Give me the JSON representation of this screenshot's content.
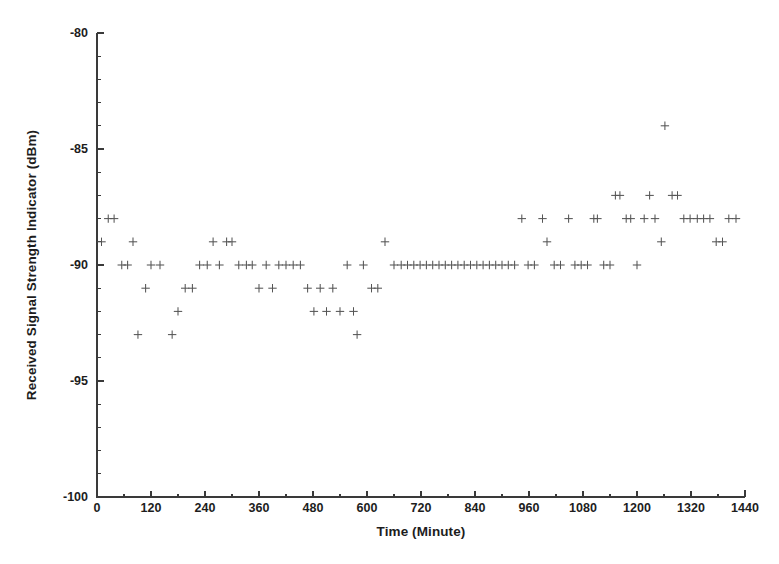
{
  "chart_data": {
    "type": "scatter",
    "title": "",
    "xlabel": "Time (Minute)",
    "ylabel": "Received Signal Strength Indicator (dBm)",
    "xlim": [
      0,
      1440
    ],
    "ylim": [
      -100,
      -80
    ],
    "xticks": [
      0,
      120,
      240,
      360,
      480,
      600,
      720,
      840,
      960,
      1080,
      1200,
      1320,
      1440
    ],
    "xtick_labels": [
      "0",
      "120",
      "240",
      "360",
      "480",
      "600",
      "720",
      "840",
      "960",
      "1080",
      "1200",
      "1320",
      "1440"
    ],
    "x_minor_step": 60,
    "yticks": [
      -80,
      -85,
      -90,
      -95,
      -100
    ],
    "ytick_labels": [
      "-80",
      "-85",
      "-90",
      "-95",
      "-100"
    ],
    "y_minor_step": 1,
    "grid": false,
    "legend": null,
    "marker": "plus",
    "marker_color": "#555555",
    "series": [
      {
        "name": "RSSI",
        "points": [
          [
            10,
            -89
          ],
          [
            25,
            -88
          ],
          [
            38,
            -88
          ],
          [
            55,
            -90
          ],
          [
            68,
            -90
          ],
          [
            80,
            -89
          ],
          [
            91,
            -93
          ],
          [
            108,
            -91
          ],
          [
            120,
            -90
          ],
          [
            140,
            -90
          ],
          [
            167,
            -93
          ],
          [
            180,
            -92
          ],
          [
            196,
            -91
          ],
          [
            212,
            -91
          ],
          [
            228,
            -90
          ],
          [
            245,
            -90
          ],
          [
            258,
            -89
          ],
          [
            272,
            -90
          ],
          [
            288,
            -89
          ],
          [
            300,
            -89
          ],
          [
            315,
            -90
          ],
          [
            332,
            -90
          ],
          [
            345,
            -90
          ],
          [
            360,
            -91
          ],
          [
            376,
            -90
          ],
          [
            390,
            -91
          ],
          [
            404,
            -90
          ],
          [
            420,
            -90
          ],
          [
            436,
            -90
          ],
          [
            452,
            -90
          ],
          [
            468,
            -91
          ],
          [
            482,
            -92
          ],
          [
            496,
            -91
          ],
          [
            510,
            -92
          ],
          [
            524,
            -91
          ],
          [
            540,
            -92
          ],
          [
            556,
            -90
          ],
          [
            570,
            -92
          ],
          [
            578,
            -93
          ],
          [
            592,
            -90
          ],
          [
            610,
            -91
          ],
          [
            624,
            -91
          ],
          [
            640,
            -89
          ],
          [
            660,
            -90
          ],
          [
            676,
            -90
          ],
          [
            690,
            -90
          ],
          [
            704,
            -90
          ],
          [
            718,
            -90
          ],
          [
            732,
            -90
          ],
          [
            746,
            -90
          ],
          [
            760,
            -90
          ],
          [
            774,
            -90
          ],
          [
            788,
            -90
          ],
          [
            802,
            -90
          ],
          [
            816,
            -90
          ],
          [
            830,
            -90
          ],
          [
            844,
            -90
          ],
          [
            858,
            -90
          ],
          [
            872,
            -90
          ],
          [
            886,
            -90
          ],
          [
            900,
            -90
          ],
          [
            914,
            -90
          ],
          [
            928,
            -90
          ],
          [
            944,
            -88
          ],
          [
            958,
            -90
          ],
          [
            972,
            -90
          ],
          [
            990,
            -88
          ],
          [
            1000,
            -89
          ],
          [
            1016,
            -90
          ],
          [
            1030,
            -90
          ],
          [
            1048,
            -88
          ],
          [
            1062,
            -90
          ],
          [
            1076,
            -90
          ],
          [
            1090,
            -90
          ],
          [
            1104,
            -88
          ],
          [
            1112,
            -88
          ],
          [
            1126,
            -90
          ],
          [
            1140,
            -90
          ],
          [
            1152,
            -87
          ],
          [
            1162,
            -87
          ],
          [
            1176,
            -88
          ],
          [
            1186,
            -88
          ],
          [
            1200,
            -90
          ],
          [
            1216,
            -88
          ],
          [
            1228,
            -87
          ],
          [
            1240,
            -88
          ],
          [
            1254,
            -89
          ],
          [
            1262,
            -84
          ],
          [
            1278,
            -87
          ],
          [
            1290,
            -87
          ],
          [
            1304,
            -88
          ],
          [
            1318,
            -88
          ],
          [
            1334,
            -88
          ],
          [
            1348,
            -88
          ],
          [
            1362,
            -88
          ],
          [
            1376,
            -89
          ],
          [
            1390,
            -89
          ],
          [
            1404,
            -88
          ],
          [
            1420,
            -88
          ]
        ]
      }
    ]
  },
  "axes": {
    "ylabel_text": "Received Signal Strength Indicator (dBm)",
    "xlabel_text": "Time (Minute)"
  }
}
